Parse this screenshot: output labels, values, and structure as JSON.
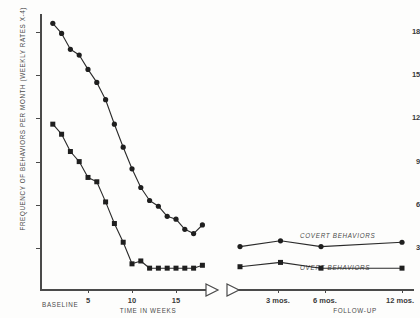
{
  "chart_data": {
    "type": "line",
    "title": "",
    "xlabel": "TIME IN WEEKS",
    "ylabel": "FREQUENCY OF BEHAVIORS PER MONTH (WEEKLY RATES X-4)",
    "ylim": [
      0,
      19
    ],
    "y_ticks": [
      18,
      15,
      12,
      9,
      6,
      3
    ],
    "grid": false,
    "legend_position": "inline-right",
    "phases": [
      {
        "name": "BASELINE",
        "label": "BASELINE"
      },
      {
        "name": "FOLLOW-UP",
        "label": "FOLLOW-UP"
      }
    ],
    "treatment_x_ticks": [
      {
        "label": "5",
        "value": 5
      },
      {
        "label": "10",
        "value": 10
      },
      {
        "label": "15",
        "value": 15
      }
    ],
    "followup_x_ticks": [
      {
        "label": "3 mos.",
        "value": 3
      },
      {
        "label": "6 mos.",
        "value": 6
      },
      {
        "label": "12 mos.",
        "value": 12
      }
    ],
    "series": [
      {
        "name": "COVERT BEHAVIORS",
        "marker": "circle",
        "treatment_x": [
          1,
          2,
          3,
          4,
          5,
          6,
          7,
          8,
          9,
          10,
          11,
          12,
          13,
          14,
          15,
          16,
          17,
          18
        ],
        "treatment_y": [
          18.6,
          17.9,
          16.8,
          16.4,
          15.4,
          14.5,
          13.3,
          11.6,
          10.0,
          8.5,
          7.2,
          6.3,
          5.9,
          5.2,
          5.0,
          4.3,
          4.0,
          4.6
        ],
        "followup_x": [
          0,
          3,
          6,
          12
        ],
        "followup_y": [
          3.1,
          3.5,
          3.1,
          3.4
        ]
      },
      {
        "name": "OVERT BEHAVIORS",
        "marker": "square",
        "treatment_x": [
          1,
          2,
          3,
          4,
          5,
          6,
          7,
          8,
          9,
          10,
          11,
          12,
          13,
          14,
          15,
          16,
          17,
          18
        ],
        "treatment_y": [
          11.6,
          10.9,
          9.7,
          9.0,
          7.9,
          7.6,
          6.2,
          4.7,
          3.4,
          1.9,
          2.1,
          1.6,
          1.6,
          1.6,
          1.6,
          1.6,
          1.6,
          1.8
        ],
        "followup_x": [
          0,
          3,
          6,
          12
        ],
        "followup_y": [
          1.7,
          2.0,
          1.6,
          1.6
        ]
      }
    ]
  },
  "axis": {
    "baseline_label": "BASELINE",
    "time_label": "TIME IN WEEKS",
    "followup_label": "FOLLOW-UP",
    "y_title": "FREQUENCY OF BEHAVIORS PER MONTH (WEEKLY RATES X-4)"
  },
  "annotations": {
    "covert": "COVERT BEHAVIORS",
    "overt": "OVERT BEHAVIORS"
  }
}
